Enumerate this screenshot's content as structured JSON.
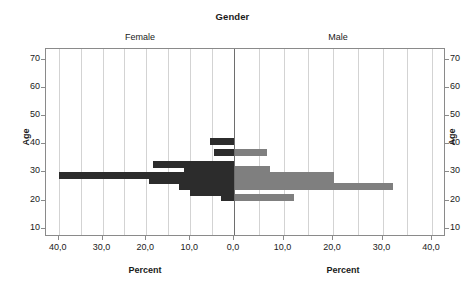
{
  "chart": {
    "title": "Gender",
    "panels": [
      {
        "key": "female",
        "label": "Female",
        "color": "#2c2c2c"
      },
      {
        "key": "male",
        "label": "Male",
        "color": "#7f7f7f"
      }
    ],
    "y_axis": {
      "title_left": "Age",
      "title_right": "Age",
      "ticks": [
        "70",
        "60",
        "50",
        "40",
        "30",
        "20",
        "10"
      ],
      "tick_values": [
        70,
        60,
        50,
        40,
        30,
        20,
        10
      ],
      "range": [
        7,
        74
      ]
    },
    "x_axis": {
      "title_left": "Percent",
      "title_right": "Percent",
      "ticks_left": [
        "40,0",
        "30,0",
        "20,0",
        "10,0",
        "0,0"
      ],
      "ticks_right": [
        "0,0",
        "10,0",
        "20,0",
        "30,0",
        "40,0"
      ],
      "tick_values": [
        40,
        30,
        20,
        10,
        0,
        10,
        20,
        30,
        40
      ],
      "range": [
        0,
        42
      ],
      "decimal_separator": ","
    }
  },
  "chart_data": {
    "type": "bar",
    "subtype": "population-pyramid",
    "title": "Gender",
    "xlabel": "Percent",
    "ylabel": "Age",
    "orientation": "horizontal",
    "grid": true,
    "legend": "panel-labels",
    "legend_position": "top",
    "xlim": [
      0,
      42
    ],
    "ylim": [
      7,
      74
    ],
    "categories": [
      19,
      21,
      23,
      25,
      27,
      29,
      31,
      33,
      35,
      37,
      39,
      41
    ],
    "category_label": "Age",
    "series": [
      {
        "name": "Female",
        "color": "#2c2c2c",
        "direction": "left",
        "values": [
          0.0,
          3.0,
          10.0,
          12.5,
          19.5,
          40.0,
          11.5,
          18.5,
          0.0,
          4.5,
          0.0,
          5.5
        ]
      },
      {
        "name": "Male",
        "color": "#7f7f7f",
        "direction": "right",
        "values": [
          0.0,
          12.0,
          0.0,
          32.0,
          20.0,
          20.0,
          7.0,
          0.0,
          0.0,
          6.5,
          0.0,
          0.0
        ]
      }
    ]
  }
}
